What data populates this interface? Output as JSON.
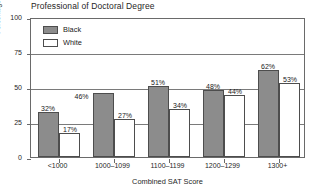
{
  "chart_data": {
    "type": "bar",
    "title": "Professional of Doctoral Degree",
    "xlabel": "Combined SAT Score",
    "ylabel": "Percentage of Graduates",
    "categories": [
      "<1000",
      "1000–1099",
      "1100–1199",
      "1200–1299",
      "1300+"
    ],
    "ylim": [
      0,
      100
    ],
    "yticks": [
      0,
      25,
      50,
      75,
      100
    ],
    "ytick_labels": [
      "0",
      "25",
      "50",
      "75",
      "100"
    ],
    "grid": true,
    "legend_position": "top-left-inside",
    "series": [
      {
        "name": "Black",
        "color": "#8c8c8c",
        "values": [
          32,
          46,
          51,
          48,
          62
        ],
        "data_labels": [
          "32%",
          "46%",
          "51%",
          "48%",
          "62%"
        ]
      },
      {
        "name": "White",
        "color": "#ffffff",
        "values": [
          17,
          27,
          34,
          44,
          53
        ],
        "data_labels": [
          "17%",
          "27%",
          "34%",
          "44%",
          "53%"
        ]
      }
    ]
  },
  "legend": {
    "items": [
      {
        "label": "Black",
        "swatch": "black"
      },
      {
        "label": "White",
        "swatch": "white"
      }
    ]
  }
}
